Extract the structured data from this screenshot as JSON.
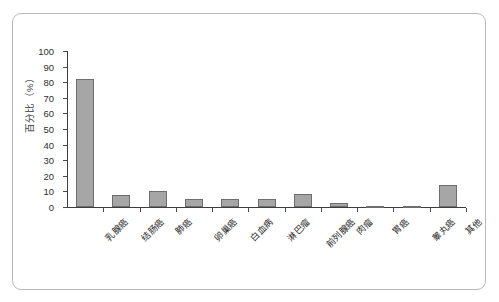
{
  "chart_data": {
    "type": "bar",
    "title": "",
    "subtitle": "",
    "xlabel": "",
    "ylabel": "百分比（%）",
    "ylim": [
      0,
      100
    ],
    "yticks": [
      0,
      10,
      20,
      30,
      40,
      50,
      60,
      70,
      80,
      90,
      100
    ],
    "grid": false,
    "legend": "none",
    "bar_color": "#a6a6a6",
    "bar_edge_color": "#6e6e6e",
    "axis_color": "#3d3d3d",
    "frame_color": "#b9b9b9",
    "categories": [
      "乳腺癌",
      "结肠癌",
      "肺癌",
      "卵巢癌",
      "白血病",
      "淋巴瘤",
      "前列腺癌",
      "肉瘤",
      "胃癌",
      "睾丸癌",
      "其他"
    ],
    "values": [
      82,
      8,
      10,
      5,
      5,
      5,
      8.5,
      2.5,
      0.8,
      0.8,
      14
    ]
  }
}
